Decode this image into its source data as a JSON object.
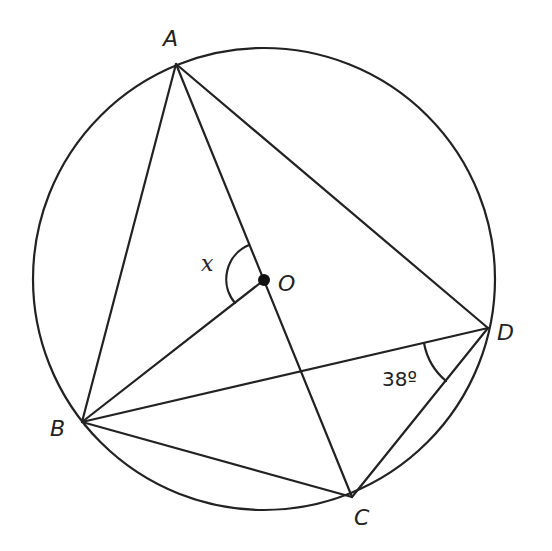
{
  "diagram": {
    "type": "circle-geometry",
    "circle": {
      "center_label": "O",
      "cx": 264,
      "cy": 279,
      "r": 231
    },
    "points": {
      "A": {
        "label": "A",
        "x": 176,
        "y": 64
      },
      "B": {
        "label": "B",
        "x": 82,
        "y": 422
      },
      "C": {
        "label": "C",
        "x": 352,
        "y": 497
      },
      "D": {
        "label": "D",
        "x": 488,
        "y": 328
      },
      "O": {
        "label": "O",
        "x": 264,
        "y": 280
      }
    },
    "segments": [
      "AB",
      "AD",
      "AC",
      "BO",
      "BD",
      "BC",
      "CD"
    ],
    "angles": {
      "x": {
        "label": "x",
        "vertex": "O",
        "between": [
          "OA",
          "OB"
        ]
      },
      "d": {
        "label": "38º",
        "vertex": "D",
        "between": [
          "DB",
          "DC"
        ]
      }
    }
  }
}
